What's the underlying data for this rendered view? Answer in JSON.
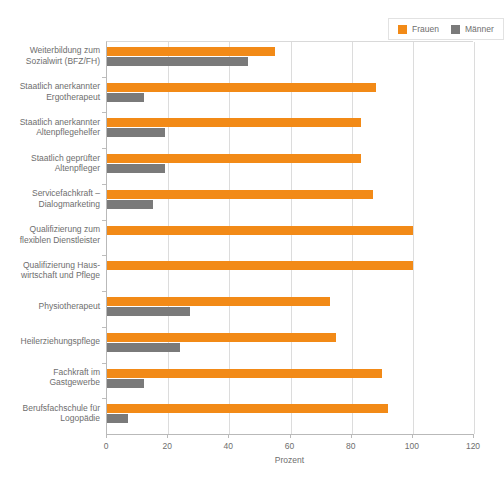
{
  "chart_data": {
    "type": "bar",
    "orientation": "horizontal",
    "title": "",
    "xlabel": "Prozent",
    "ylabel": "",
    "xlim": [
      0,
      120
    ],
    "xticks": [
      0,
      20,
      40,
      60,
      80,
      100,
      120
    ],
    "grid": true,
    "legend_position": "top-right",
    "categories": [
      "Weiterbildung zum Sozialwirt (BFZ/FH)",
      "Staatlich anerkannter Ergotherapeut",
      "Staatlich anerkannter Altenpflegehelfer",
      "Staatlich geprüfter Altenpfleger",
      "Servicefachkraft – Dialogmarketing",
      "Qualifizierung zum flexiblen Dienstleister",
      "Qualifizierung Hauswirtschaft und Pflege",
      "Physiotherapeut",
      "Heilerziehungspflege",
      "Fachkraft im Gastgewerbe",
      "Berufsfachschule für Logopädie"
    ],
    "category_lines": [
      [
        "Weiterbildung zum",
        "Sozialwirt (BFZ/FH)"
      ],
      [
        "Staatlich anerkannter",
        "Ergotherapeut"
      ],
      [
        "Staatlich anerkannter",
        "Altenpflegehelfer"
      ],
      [
        "Staatlich geprüfter",
        "Altenpfleger"
      ],
      [
        "Servicefachkraft –",
        "Dialogmarketing"
      ],
      [
        "Qualifizierung zum",
        "flexiblen Dienstleister"
      ],
      [
        "Qualifizierung Haus-",
        "wirtschaft und Pflege"
      ],
      [
        "Physiotherapeut"
      ],
      [
        "Heilerziehungspflege"
      ],
      [
        "Fachkraft im",
        "Gastgewerbe"
      ],
      [
        "Berufsfachschule für",
        "Logopädie"
      ]
    ],
    "series": [
      {
        "name": "Frauen",
        "color": "#f28a17",
        "values": [
          55,
          88,
          83,
          83,
          87,
          100,
          100,
          73,
          75,
          90,
          92
        ]
      },
      {
        "name": "Männer",
        "color": "#7a7a7a",
        "values": [
          46,
          12,
          19,
          19,
          15,
          0,
          0,
          27,
          24,
          12,
          7
        ]
      }
    ]
  },
  "legend": {
    "items": [
      {
        "label": "Frauen",
        "color": "#f28a17"
      },
      {
        "label": "Männer",
        "color": "#7a7a7a"
      }
    ]
  },
  "axis": {
    "x_title": "Prozent",
    "x_tick_labels": [
      "0",
      "20",
      "40",
      "60",
      "80",
      "100",
      "120"
    ]
  },
  "colors": {
    "frauen": "#f28a17",
    "maenner": "#7a7a7a",
    "grid": "#dcdcdc",
    "axis": "#b9b9b9",
    "text": "#6e6e6e",
    "background": "#ffffff"
  }
}
